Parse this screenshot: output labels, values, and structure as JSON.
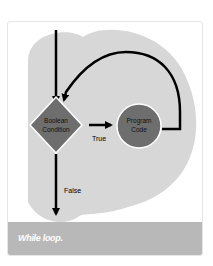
{
  "figure": {
    "caption": "While loop.",
    "nodes": {
      "condition": {
        "line1": "Boolean",
        "line2": "Condition",
        "shape": "diamond"
      },
      "program": {
        "line1": "Program",
        "line2": "Code",
        "shape": "circle"
      }
    },
    "edge_labels": {
      "true": "True",
      "false": "False"
    },
    "colors": {
      "card_bg": "#ffffff",
      "blob": "#d7d7d7",
      "node_fill": "#6e6e6e",
      "node_stroke": "#ffffff",
      "arrow": "#000000",
      "caption_bar": "#b8b8b8",
      "caption_text": "#ffffff"
    }
  }
}
